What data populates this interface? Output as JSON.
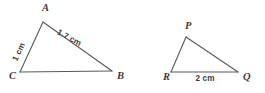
{
  "figure": {
    "background_color": "#ffffff",
    "stroke_color": "#58585a",
    "label_color": "#3b3b3d",
    "width": 265,
    "height": 93
  },
  "triangles": [
    {
      "name": "triangle-abc",
      "vertices": [
        {
          "label": "A",
          "x": 43,
          "y": 22,
          "label_x": 42,
          "label_y": 11
        },
        {
          "label": "C",
          "x": 20,
          "y": 72,
          "label_x": 9,
          "label_y": 79
        },
        {
          "label": "B",
          "x": 112,
          "y": 71,
          "label_x": 117,
          "label_y": 79
        }
      ],
      "edges": [
        {
          "name": "edge-ca",
          "from": "C",
          "to": "A"
        },
        {
          "name": "edge-ab",
          "from": "A",
          "to": "B"
        },
        {
          "name": "edge-cb",
          "from": "C",
          "to": "B"
        }
      ],
      "side_labels": [
        {
          "name": "side-label-ca",
          "text": "1 cm",
          "x": 21,
          "y": 53,
          "rotation": -65
        },
        {
          "name": "side-label-ab",
          "text": "1.7 cm",
          "x": 68,
          "y": 40,
          "rotation": 28
        }
      ]
    },
    {
      "name": "triangle-pqr",
      "vertices": [
        {
          "label": "P",
          "x": 186,
          "y": 37,
          "label_x": 185,
          "label_y": 29
        },
        {
          "label": "R",
          "x": 171,
          "y": 72,
          "label_x": 163,
          "label_y": 80
        },
        {
          "label": "Q",
          "x": 238,
          "y": 72,
          "label_x": 243,
          "label_y": 80
        }
      ],
      "edges": [
        {
          "name": "edge-rp",
          "from": "R",
          "to": "P"
        },
        {
          "name": "edge-pq",
          "from": "P",
          "to": "Q"
        },
        {
          "name": "edge-rq",
          "from": "R",
          "to": "Q"
        }
      ],
      "side_labels": [
        {
          "name": "side-label-rq",
          "text": "2 cm",
          "x": 205,
          "y": 81,
          "rotation": 0
        }
      ]
    }
  ]
}
